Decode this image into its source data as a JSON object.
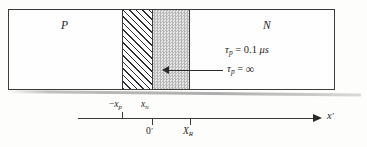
{
  "figure": {
    "regions": {
      "p_label": "P",
      "n_label": "N",
      "hatched_region_name": "space-charge-hatched-region",
      "stippled_region_name": "recombination-stippled-region"
    },
    "annotations": {
      "tau_finite": {
        "symbol": "τ",
        "subscript": "p",
        "relation": "=",
        "value": "0.1",
        "unit": "μs"
      },
      "tau_infinite": {
        "symbol": "τ",
        "subscript": "p",
        "relation": "=",
        "value": "∞"
      }
    },
    "axis": {
      "label": "x",
      "label_prime": "′",
      "ticks": [
        {
          "name": "minus-xp",
          "label_prefix": "−",
          "label": "x",
          "subscript": "p",
          "position": "above"
        },
        {
          "name": "xn",
          "label_prefix": "",
          "label": "x",
          "subscript": "n",
          "position": "above"
        },
        {
          "name": "origin",
          "label_prefix": "",
          "label": "0",
          "prime": "′",
          "position": "below"
        },
        {
          "name": "XR",
          "label_prefix": "",
          "label": "X",
          "subscript": "R",
          "position": "below"
        }
      ]
    },
    "colors": {
      "line": "#3a3a3a",
      "text": "#1d1d1d",
      "stipple_fill": "#d7d7d7",
      "background": "#fdfdfc"
    }
  }
}
